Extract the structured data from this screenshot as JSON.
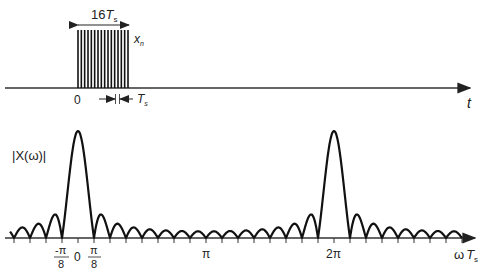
{
  "top_plot": {
    "pulse_count": 16,
    "width_label": "16",
    "width_label_var": "T",
    "width_label_sub": "s",
    "signal_label": "x",
    "signal_label_sub": "n",
    "origin_label": "0",
    "spacing_label": "T",
    "spacing_label_sub": "s",
    "axis_label": "t"
  },
  "bottom_plot": {
    "y_label": "|X(ω)|",
    "x_label_prefix": "ω",
    "x_label_var": "T",
    "x_label_sub": "s",
    "ticks": [
      {
        "id": "neg_pi_8",
        "num": "-π",
        "den": "8"
      },
      {
        "id": "zero",
        "text": "0"
      },
      {
        "id": "pi_8",
        "num": "π",
        "den": "8"
      },
      {
        "id": "pi",
        "text": "π"
      },
      {
        "id": "two_pi",
        "text": "2π"
      }
    ]
  },
  "colors": {
    "line": "#111111",
    "axis": "#333333"
  }
}
